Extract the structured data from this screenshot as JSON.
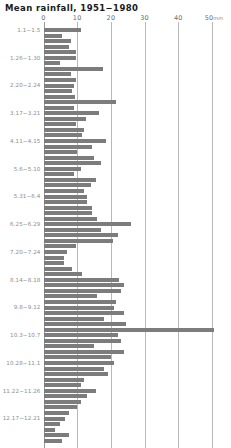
{
  "chart_data": {
    "type": "bar",
    "orientation": "horizontal",
    "title": "Mean rainfall, 1951−1980",
    "xlabel": "mm",
    "ylabel": "",
    "xlim": [
      0,
      52
    ],
    "ylim": null,
    "grid": true,
    "legend": null,
    "x_unit": "mm",
    "x_ticks": [
      0,
      10,
      20,
      30,
      40,
      50
    ],
    "x_tick_labels": [
      "0",
      "10",
      "20",
      "30",
      "40",
      "50"
    ],
    "bar_color": "#7c7c7c",
    "grid_color": "#b9b9b9",
    "axis_color": "#9a9a9a",
    "label_color": "#8e8e8e",
    "title_color": "#1a1a1a",
    "visible_category_labels": [
      {
        "index": 0,
        "label": "1.1−1.5"
      },
      {
        "index": 5,
        "label": "1.26−1.30"
      },
      {
        "index": 10,
        "label": "2.20−2.24"
      },
      {
        "index": 15,
        "label": "3.17−3.21"
      },
      {
        "index": 20,
        "label": "4.11−4.15"
      },
      {
        "index": 25,
        "label": "5.6−5.10"
      },
      {
        "index": 30,
        "label": "5.31−6.4"
      },
      {
        "index": 35,
        "label": "6.25−6.29"
      },
      {
        "index": 40,
        "label": "7.20−7.24"
      },
      {
        "index": 45,
        "label": "8.14−8.18"
      },
      {
        "index": 50,
        "label": "9.8−9.12"
      },
      {
        "index": 55,
        "label": "10.3−10.7"
      },
      {
        "index": 60,
        "label": "10.28−11.1"
      },
      {
        "index": 65,
        "label": "11.22−11.26"
      },
      {
        "index": 70,
        "label": "12.17−12.21"
      }
    ],
    "categories": [
      "1.1−1.5",
      "1.6−1.10",
      "1.11−1.15",
      "1.16−1.20",
      "1.21−1.25",
      "1.26−1.30",
      "1.31−2.4",
      "2.5−2.9",
      "2.10−2.14",
      "2.15−2.19",
      "2.20−2.24",
      "2.25−3.1",
      "3.2−3.6",
      "3.7−3.11",
      "3.12−3.16",
      "3.17−3.21",
      "3.22−3.26",
      "3.27−3.31",
      "4.1−4.5",
      "4.6−4.10",
      "4.11−4.15",
      "4.16−4.20",
      "4.21−4.25",
      "4.26−4.30",
      "5.1−5.5",
      "5.6−5.10",
      "5.11−5.15",
      "5.16−5.20",
      "5.21−5.25",
      "5.26−5.30",
      "5.31−6.4",
      "6.5−6.9",
      "6.10−6.14",
      "6.15−6.19",
      "6.20−6.24",
      "6.25−6.29",
      "6.30−7.4",
      "7.5−7.9",
      "7.10−7.14",
      "7.15−7.19",
      "7.20−7.24",
      "7.25−7.29",
      "7.30−8.3",
      "8.4−8.8",
      "8.9−8.13",
      "8.14−8.18",
      "8.19−8.23",
      "8.24−8.28",
      "8.29−9.2",
      "9.3−9.7",
      "9.8−9.12",
      "9.13−9.17",
      "9.18−9.22",
      "9.23−9.27",
      "9.28−10.2",
      "10.3−10.7",
      "10.8−10.12",
      "10.13−10.17",
      "10.18−10.22",
      "10.23−10.27",
      "10.28−11.1",
      "11.2−11.6",
      "11.7−11.11",
      "11.12−11.16",
      "11.17−11.21",
      "11.22−11.26",
      "11.27−12.1",
      "12.2−12.6",
      "12.7−12.11",
      "12.12−12.16",
      "12.17−12.21",
      "12.22−12.26",
      "12.27−12.31",
      "1.1b−1.2b",
      "1.3b−1.4b"
    ],
    "values": [
      11.0,
      5.5,
      8.0,
      7.5,
      9.5,
      9.6,
      4.8,
      17.5,
      8.0,
      9.5,
      9.0,
      8.5,
      9.2,
      21.5,
      9.0,
      16.5,
      12.5,
      9.5,
      12.0,
      11.5,
      18.5,
      14.5,
      10.0,
      15.0,
      17.0,
      11.0,
      9.0,
      15.5,
      14.0,
      12.0,
      13.0,
      13.0,
      14.5,
      14.5,
      16.0,
      26.0,
      17.0,
      22.0,
      20.5,
      9.5,
      7.0,
      6.0,
      6.0,
      8.5,
      11.5,
      22.5,
      24.0,
      23.0,
      16.0,
      21.5,
      21.0,
      24.0,
      18.0,
      24.5,
      50.5,
      22.0,
      23.0,
      15.0,
      24.0,
      20.0,
      21.0,
      18.0,
      19.0,
      12.0,
      11.0,
      15.5,
      13.0,
      11.0,
      10.0,
      7.5,
      6.5,
      5.0,
      3.5,
      7.5,
      5.5
    ]
  }
}
